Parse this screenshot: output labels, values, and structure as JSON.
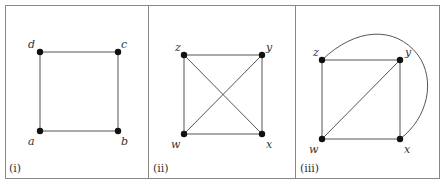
{
  "figure": {
    "panels": [
      {
        "id": "i",
        "caption": "(i)",
        "nodes": [
          {
            "name": "a",
            "x": 40,
            "y": 131
          },
          {
            "name": "b",
            "x": 118,
            "y": 131
          },
          {
            "name": "c",
            "x": 118,
            "y": 52
          },
          {
            "name": "d",
            "x": 40,
            "y": 52
          }
        ],
        "edges": [
          [
            "a",
            "b"
          ],
          [
            "b",
            "c"
          ],
          [
            "c",
            "d"
          ],
          [
            "d",
            "a"
          ]
        ]
      },
      {
        "id": "ii",
        "caption": "(ii)",
        "nodes": [
          {
            "name": "w",
            "x": 184,
            "y": 134
          },
          {
            "name": "x",
            "x": 262,
            "y": 134
          },
          {
            "name": "y",
            "x": 262,
            "y": 55
          },
          {
            "name": "z",
            "x": 184,
            "y": 55
          }
        ],
        "edges": [
          [
            "w",
            "x"
          ],
          [
            "x",
            "y"
          ],
          [
            "y",
            "z"
          ],
          [
            "z",
            "w"
          ],
          [
            "z",
            "x"
          ],
          [
            "w",
            "y"
          ]
        ]
      },
      {
        "id": "iii",
        "caption": "(iii)",
        "nodes": [
          {
            "name": "w",
            "x": 322,
            "y": 139
          },
          {
            "name": "x",
            "x": 400,
            "y": 139
          },
          {
            "name": "y",
            "x": 400,
            "y": 60
          },
          {
            "name": "z",
            "x": 322,
            "y": 60
          }
        ],
        "edges": [
          [
            "w",
            "x"
          ],
          [
            "x",
            "y"
          ],
          [
            "y",
            "z"
          ],
          [
            "z",
            "w"
          ],
          [
            "w",
            "y"
          ],
          [
            "z",
            "x",
            "curved"
          ]
        ]
      }
    ],
    "labels": {
      "p1": {
        "a": "a",
        "b": "b",
        "c": "c",
        "d": "d",
        "cap": "(i)"
      },
      "p2": {
        "w": "w",
        "x": "x",
        "y": "y",
        "z": "z",
        "cap": "(ii)"
      },
      "p3": {
        "w": "w",
        "x": "x",
        "y": "y",
        "z": "z",
        "cap": "(iii)"
      }
    },
    "colors": {
      "edge": "#555555",
      "node": "#111111",
      "frame": "#888888"
    }
  }
}
